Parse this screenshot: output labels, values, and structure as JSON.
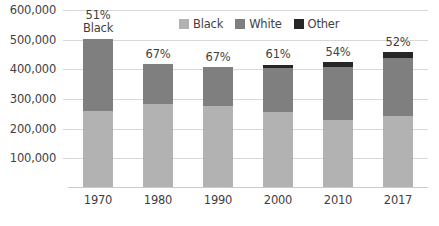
{
  "chart_data": {
    "type": "bar",
    "subtype": "stacked-column",
    "title": "",
    "xlabel": "",
    "ylabel": "",
    "categories": [
      "1970",
      "1980",
      "1990",
      "2000",
      "2010",
      "2017"
    ],
    "series": [
      {
        "name": "Black",
        "color": "#b2b2b2",
        "values": [
          255000,
          280000,
          272000,
          252000,
          225000,
          238000
        ]
      },
      {
        "name": "White",
        "color": "#7f7f7f",
        "values": [
          245000,
          135000,
          133000,
          148000,
          180000,
          197000
        ]
      },
      {
        "name": "Other",
        "color": "#262626",
        "values": [
          0,
          0,
          0,
          13000,
          15000,
          20000
        ]
      }
    ],
    "totals": [
      500000,
      415000,
      405000,
      413000,
      420000,
      455000
    ],
    "data_labels": [
      "51%",
      "67%",
      "67%",
      "61%",
      "54%",
      "52%"
    ],
    "first_label_sub": "Black",
    "ylim": [
      0,
      600000
    ],
    "y_ticks": [
      100000,
      200000,
      300000,
      400000,
      500000,
      600000
    ],
    "y_tick_labels": [
      "100,000",
      "200,000",
      "300,000",
      "400,000",
      "500,000",
      "600,000"
    ],
    "grid": true,
    "legend_position": "top-center",
    "legend": [
      {
        "label": "Black",
        "color": "#b2b2b2"
      },
      {
        "label": "White",
        "color": "#7f7f7f"
      },
      {
        "label": "Other",
        "color": "#262626"
      }
    ]
  }
}
